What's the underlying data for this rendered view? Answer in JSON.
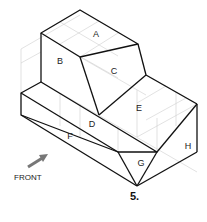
{
  "figure": {
    "number_label": "5.",
    "direction_label": "FRONT",
    "face_labels": [
      {
        "text": "A",
        "x": 96,
        "y": 34
      },
      {
        "text": "B",
        "x": 60,
        "y": 61
      },
      {
        "text": "C",
        "x": 114,
        "y": 71
      },
      {
        "text": "D",
        "x": 92,
        "y": 124
      },
      {
        "text": "E",
        "x": 139,
        "y": 108
      },
      {
        "text": "F",
        "x": 70,
        "y": 136
      },
      {
        "text": "G",
        "x": 141,
        "y": 163
      },
      {
        "text": "H",
        "x": 188,
        "y": 146
      }
    ],
    "colors": {
      "line": "#111111",
      "grid": "#cccccc",
      "arrow": "#777777"
    }
  }
}
